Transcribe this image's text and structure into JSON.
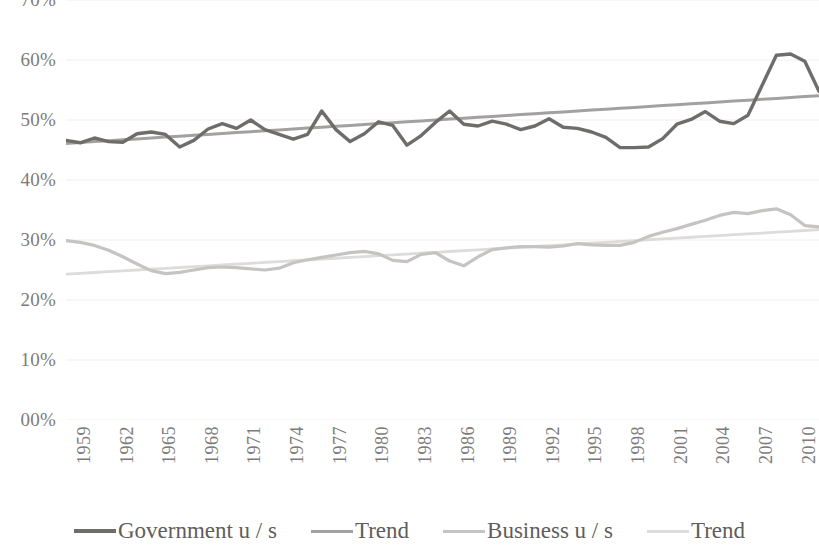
{
  "chart_data": {
    "type": "line",
    "title": "",
    "xlabel": "",
    "ylabel": "",
    "ylim": [
      0,
      70
    ],
    "ytick_labels": [
      "70%",
      "60%",
      "50%",
      "40%",
      "30%",
      "20%",
      "10%",
      "00%"
    ],
    "ytick_values": [
      70,
      60,
      50,
      40,
      30,
      20,
      10,
      0
    ],
    "grid": true,
    "grid_color": "#efefef",
    "legend_position": "bottom",
    "x": [
      1959,
      1960,
      1961,
      1962,
      1963,
      1964,
      1965,
      1966,
      1967,
      1968,
      1969,
      1970,
      1971,
      1972,
      1973,
      1974,
      1975,
      1976,
      1977,
      1978,
      1979,
      1980,
      1981,
      1982,
      1983,
      1984,
      1985,
      1986,
      1987,
      1988,
      1989,
      1990,
      1991,
      1992,
      1993,
      1994,
      1995,
      1996,
      1997,
      1998,
      1999,
      2000,
      2001,
      2002,
      2003,
      2004,
      2005,
      2006,
      2007,
      2008,
      2009,
      2010,
      2011,
      2012
    ],
    "xtick_labels": [
      "1959",
      "1962",
      "1965",
      "1968",
      "1971",
      "1974",
      "1977",
      "1980",
      "1983",
      "1986",
      "1989",
      "1992",
      "1995",
      "1998",
      "2001",
      "2004",
      "2007",
      "2010"
    ],
    "xtick_values": [
      1959,
      1962,
      1965,
      1968,
      1971,
      1974,
      1977,
      1980,
      1983,
      1986,
      1989,
      1992,
      1995,
      1998,
      2001,
      2004,
      2007,
      2010
    ],
    "series": [
      {
        "name": "Government u / s",
        "kind": "data",
        "color": "#6f6d6b",
        "width": 3.4,
        "values": [
          46.6,
          46.2,
          47.0,
          46.4,
          46.3,
          47.7,
          48.0,
          47.6,
          45.5,
          46.6,
          48.5,
          49.4,
          48.6,
          50.0,
          48.4,
          47.6,
          46.8,
          47.6,
          51.5,
          48.4,
          46.4,
          47.7,
          49.7,
          49.1,
          45.8,
          47.4,
          49.6,
          51.5,
          49.3,
          49.0,
          49.8,
          49.3,
          48.4,
          49.0,
          50.2,
          48.8,
          48.6,
          48.0,
          47.1,
          45.4,
          45.4,
          45.5,
          46.9,
          49.3,
          50.1,
          51.4,
          49.8,
          49.4,
          50.8,
          55.8,
          60.8,
          61.0,
          59.8,
          54.8
        ]
      },
      {
        "name": "Trend",
        "kind": "trend",
        "for": "Government u / s",
        "color": "#a3a1a0",
        "width": 3.0,
        "values": [
          46.1,
          46.25,
          46.4,
          46.55,
          46.7,
          46.85,
          47.0,
          47.15,
          47.3,
          47.45,
          47.6,
          47.75,
          47.9,
          48.05,
          48.2,
          48.35,
          48.5,
          48.65,
          48.8,
          48.95,
          49.1,
          49.25,
          49.4,
          49.55,
          49.7,
          49.85,
          50.0,
          50.15,
          50.3,
          50.45,
          50.6,
          50.75,
          50.9,
          51.05,
          51.2,
          51.35,
          51.5,
          51.65,
          51.8,
          51.95,
          52.1,
          52.25,
          52.4,
          52.55,
          52.7,
          52.85,
          53.0,
          53.15,
          53.3,
          53.45,
          53.6,
          53.75,
          53.9,
          54.05
        ]
      },
      {
        "name": "Business u / s",
        "kind": "data",
        "color": "#c6c4c3",
        "width": 3.2,
        "values": [
          29.9,
          29.6,
          29.1,
          28.3,
          27.2,
          26.0,
          24.9,
          24.4,
          24.6,
          25.0,
          25.4,
          25.5,
          25.4,
          25.2,
          25.0,
          25.3,
          26.2,
          26.7,
          27.1,
          27.5,
          27.9,
          28.1,
          27.7,
          26.6,
          26.4,
          27.6,
          27.9,
          26.5,
          25.7,
          27.2,
          28.4,
          28.7,
          28.9,
          28.9,
          28.8,
          29.0,
          29.4,
          29.2,
          29.1,
          29.1,
          29.6,
          30.6,
          31.3,
          31.9,
          32.6,
          33.3,
          34.1,
          34.6,
          34.4,
          34.9,
          35.2,
          34.2,
          32.4,
          32.2
        ]
      },
      {
        "name": "Trend",
        "kind": "trend",
        "for": "Business u / s",
        "color": "#dedcdb",
        "width": 2.8,
        "values": [
          24.3,
          24.44,
          24.58,
          24.72,
          24.86,
          25.0,
          25.14,
          25.28,
          25.42,
          25.56,
          25.7,
          25.84,
          25.98,
          26.12,
          26.26,
          26.4,
          26.54,
          26.68,
          26.82,
          26.96,
          27.1,
          27.24,
          27.38,
          27.52,
          27.66,
          27.8,
          27.94,
          28.08,
          28.22,
          28.36,
          28.5,
          28.64,
          28.78,
          28.92,
          29.06,
          29.2,
          29.34,
          29.48,
          29.62,
          29.76,
          29.9,
          30.04,
          30.18,
          30.32,
          30.46,
          30.6,
          30.74,
          30.88,
          31.02,
          31.16,
          31.3,
          31.44,
          31.58,
          31.72
        ]
      }
    ]
  },
  "legend": {
    "items": [
      {
        "label": "Government u / s",
        "color": "#6f6d6b",
        "width": 4
      },
      {
        "label": "Trend",
        "color": "#a3a1a0",
        "width": 3
      },
      {
        "label": "Business u / s",
        "color": "#c6c4c3",
        "width": 3
      },
      {
        "label": "Trend",
        "color": "#dedcdb",
        "width": 3
      }
    ]
  }
}
